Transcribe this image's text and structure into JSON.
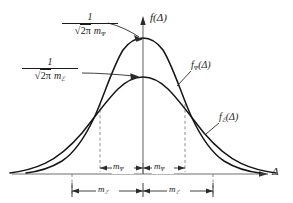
{
  "figure": {
    "background_color": "#ffffff",
    "ink_color": "#1a1a1a",
    "dash_color": "#8c8c8c"
  },
  "axes": {
    "y_axis_label": "f(Δ)",
    "y_axis_label_name": "f(Delta)",
    "x_axis_label": "Δ",
    "x_axis_label_name": "Delta",
    "origin_x": 143,
    "baseline_y": 174
  },
  "curves": [
    {
      "id": "curve-psi",
      "label": "f",
      "label_subscript": "Ψ",
      "label_arg": "(Δ)",
      "peak_amplitude_numerator": "1",
      "peak_amplitude_denominator_radical": "2π",
      "peak_amplitude_denominator_m": "m",
      "peak_amplitude_denominator_sub": "Ψ",
      "peak_y": 40,
      "sigma_px": 42,
      "description": "narrow tall gaussian"
    },
    {
      "id": "curve-epsilon",
      "label": "f",
      "label_subscript": "ℰ",
      "label_arg": "(Δ)",
      "peak_amplitude_numerator": "1",
      "peak_amplitude_denominator_radical": "2π",
      "peak_amplitude_denominator_m": "m",
      "peak_amplitude_denominator_sub": "ℰ",
      "peak_y": 77,
      "sigma_px": 70,
      "description": "broad low gaussian"
    }
  ],
  "peak_labels": [
    {
      "name": "peak-amplitude-psi",
      "numerator": "1",
      "radical_sign": "√",
      "radicand": "2π",
      "m_symbol": "m",
      "m_subscript": "Ψ",
      "arrow_to": "curve-psi-peak"
    },
    {
      "name": "peak-amplitude-epsilon",
      "numerator": "1",
      "radical_sign": "√",
      "radicand": "2π",
      "m_symbol": "m",
      "m_subscript": "ℰ",
      "arrow_to": "curve-epsilon-peak"
    }
  ],
  "span_markers": {
    "inner": {
      "name": "inner-span-psi",
      "left_label_m": "m",
      "left_label_sub": "Ψ",
      "right_label_m": "m",
      "right_label_sub": "Ψ",
      "y": 168,
      "left_x": 100,
      "center_x": 143,
      "right_x": 185
    },
    "outer": {
      "name": "outer-span-epsilon",
      "left_label_m": "m",
      "left_label_sub": "ℰ",
      "right_label_m": "m",
      "right_label_sub": "ℰ",
      "y": 191,
      "left_x": 72,
      "center_x": 143,
      "right_x": 213
    }
  },
  "dashed_verticals": [
    {
      "name": "dashed-line-outer-left",
      "x": 72,
      "top": 191,
      "bottom": 174
    },
    {
      "name": "dashed-line-inner-left",
      "x": 100,
      "top": 105,
      "bottom": 168
    },
    {
      "name": "dashed-line-inner-right",
      "x": 185,
      "top": 105,
      "bottom": 168
    },
    {
      "name": "dashed-line-outer-right",
      "x": 213,
      "top": 191,
      "bottom": 174
    }
  ]
}
